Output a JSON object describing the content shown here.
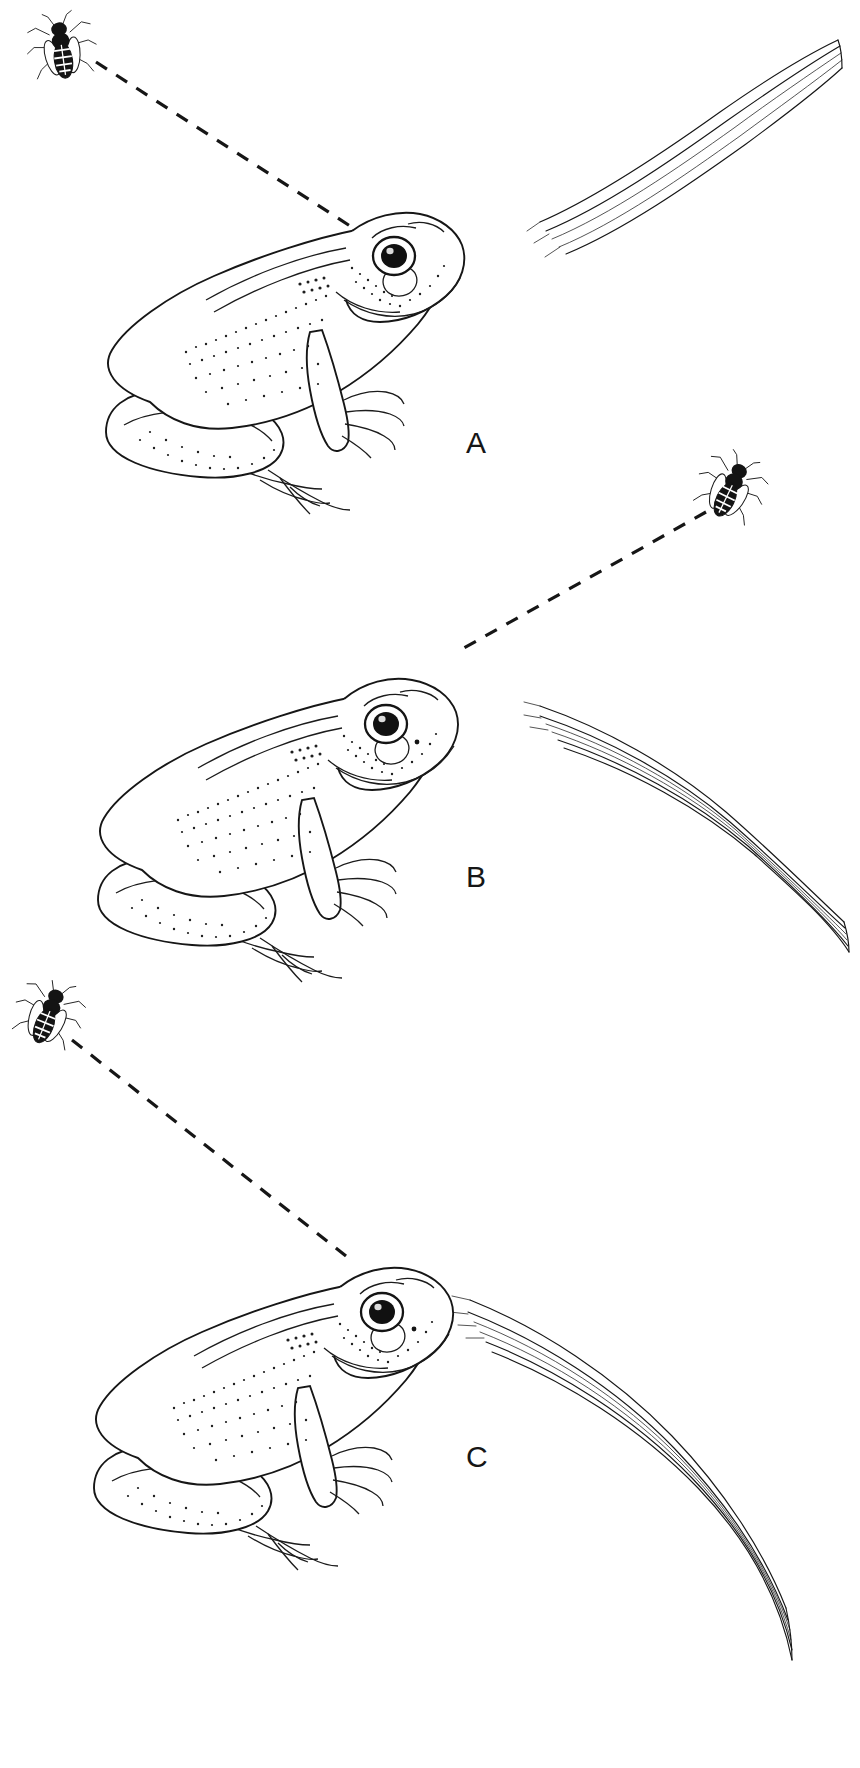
{
  "figure": {
    "background_color": "#ffffff",
    "ink_color": "#161616",
    "width": 860,
    "height": 1768,
    "caption": ""
  },
  "panels": [
    {
      "id": "a",
      "label": "A",
      "label_position": {
        "x": 466,
        "y": 428
      },
      "frog": {
        "name": "frog",
        "pose": "sitting, head turned right and slightly up",
        "position": {
          "x": 95,
          "y": 205,
          "width": 390,
          "height": 300
        },
        "eye_color": "#111111"
      },
      "insect": {
        "name": "bee",
        "position": {
          "x": 32,
          "y": 20,
          "width": 62,
          "height": 62
        },
        "orientation": "head up, viewed dorsally"
      },
      "sight_line": {
        "name": "sight-line",
        "style": "dashed",
        "from": {
          "x": 96,
          "y": 62
        },
        "to": {
          "x": 378,
          "y": 242
        }
      },
      "grass_blade": {
        "name": "grass-blade",
        "curve": "arching from lower-left to upper-right, tip at top right",
        "from": {
          "x": 538,
          "y": 222
        },
        "to": {
          "x": 840,
          "y": 38
        }
      }
    },
    {
      "id": "b",
      "label": "B",
      "label_position": {
        "x": 466,
        "y": 862
      },
      "frog": {
        "name": "frog",
        "pose": "sitting, head raised and turned right",
        "position": {
          "x": 90,
          "y": 640,
          "width": 390,
          "height": 300
        },
        "eye_color": "#111111"
      },
      "insect": {
        "name": "bee",
        "position": {
          "x": 700,
          "y": 458,
          "width": 62,
          "height": 62
        },
        "orientation": "head up-right, viewed dorsally"
      },
      "sight_line": {
        "name": "sight-line",
        "style": "dashed",
        "from": {
          "x": 706,
          "y": 512
        },
        "to": {
          "x": 464,
          "y": 648
        }
      },
      "grass_blade": {
        "name": "grass-blade",
        "curve": "arching from upper-left down to lower-right tip",
        "from": {
          "x": 538,
          "y": 706
        },
        "to": {
          "x": 846,
          "y": 916
        }
      }
    },
    {
      "id": "c",
      "label": "C",
      "label_position": {
        "x": 466,
        "y": 1442
      },
      "frog": {
        "name": "frog",
        "pose": "sitting, head turned right and slightly up",
        "position": {
          "x": 85,
          "y": 1228,
          "width": 390,
          "height": 300
        },
        "eye_color": "#111111"
      },
      "insect": {
        "name": "bee",
        "position": {
          "x": 18,
          "y": 988,
          "width": 62,
          "height": 62
        },
        "orientation": "head up-left, viewed dorsally"
      },
      "sight_line": {
        "name": "sight-line",
        "style": "dashed",
        "from": {
          "x": 72,
          "y": 1040
        },
        "to": {
          "x": 344,
          "y": 1254
        }
      },
      "grass_blade": {
        "name": "grass-blade",
        "curve": "sweeping from upper-left down to lower-right tip",
        "from": {
          "x": 470,
          "y": 1300
        },
        "to": {
          "x": 790,
          "y": 1700
        }
      }
    }
  ],
  "legend": {
    "labels": [
      "A",
      "B",
      "C"
    ],
    "note": ""
  }
}
